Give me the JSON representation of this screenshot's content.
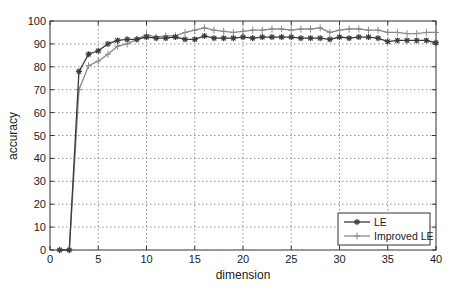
{
  "chart_data": {
    "type": "line",
    "title": "",
    "xlabel": "dimension",
    "ylabel": "accuracy",
    "xlim": [
      0,
      40
    ],
    "ylim": [
      0,
      100
    ],
    "xticks": [
      0,
      5,
      10,
      15,
      20,
      25,
      30,
      35,
      40
    ],
    "yticks": [
      0,
      10,
      20,
      30,
      40,
      50,
      60,
      70,
      80,
      90,
      100
    ],
    "grid": true,
    "legend_position": "lower right",
    "x": [
      1,
      2,
      3,
      4,
      5,
      6,
      7,
      8,
      9,
      10,
      11,
      12,
      13,
      14,
      15,
      16,
      17,
      18,
      19,
      20,
      21,
      22,
      23,
      24,
      25,
      26,
      27,
      28,
      29,
      30,
      31,
      32,
      33,
      34,
      35,
      36,
      37,
      38,
      39,
      40
    ],
    "series": [
      {
        "name": "LE",
        "color": "#3a3a3a",
        "marker": "star",
        "values": [
          0,
          0,
          78,
          85.5,
          87,
          90,
          91.5,
          92,
          92,
          93,
          92.5,
          92.5,
          93,
          92,
          92,
          93.5,
          92.5,
          92.5,
          92.5,
          93,
          92.5,
          93,
          93,
          93,
          93,
          92.5,
          92.5,
          92.5,
          92,
          93,
          92.5,
          93,
          93,
          92.5,
          91,
          91.5,
          91.5,
          91.5,
          91.5,
          90.5
        ]
      },
      {
        "name": "Improved LE",
        "color": "#8a8a8a",
        "marker": "plus",
        "values": [
          0,
          0,
          70,
          80.5,
          82.5,
          85.5,
          89,
          90,
          92,
          94,
          93,
          93.5,
          93.5,
          95,
          96,
          97,
          96,
          95.5,
          95,
          95.5,
          96,
          96,
          96.5,
          96.5,
          96,
          96.5,
          96.5,
          97,
          95,
          96,
          96.5,
          96.5,
          96,
          96,
          95,
          95,
          94.5,
          94.5,
          95,
          95
        ]
      }
    ]
  }
}
